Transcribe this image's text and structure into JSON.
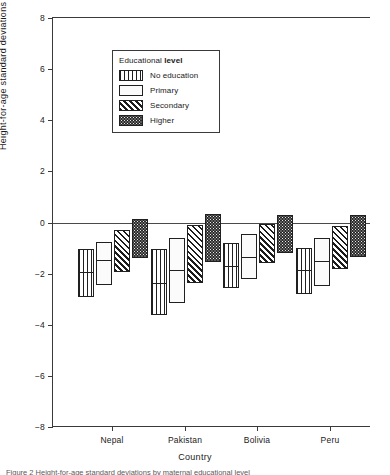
{
  "figure": {
    "caption_sliver": "Figure 2  Height-for-age standard deviations by maternal educational level"
  },
  "legend": {
    "title_prefix": "Educational ",
    "title_bold": "level",
    "position": "inside-top-center",
    "items": [
      {
        "label": "No education",
        "pattern": "vertical",
        "swatch_name": "legend-swatch-no-education"
      },
      {
        "label": "Primary",
        "pattern": "dots",
        "swatch_name": "legend-swatch-primary"
      },
      {
        "label": "Secondary",
        "pattern": "diagonal",
        "swatch_name": "legend-swatch-secondary"
      },
      {
        "label": "Higher",
        "pattern": "dense",
        "swatch_name": "legend-swatch-higher"
      }
    ]
  },
  "chart_data": {
    "type": "bar",
    "title": "",
    "subtitle": "",
    "xlabel": "Country",
    "ylabel": "Height-for-age  standard deviations",
    "ylim": [
      -8,
      8
    ],
    "yticks": [
      8,
      6,
      4,
      2,
      0,
      -2,
      -4,
      -6,
      -8
    ],
    "ytick_labels": [
      "8",
      "6",
      "4",
      "2",
      "0",
      "−2",
      "−4",
      "−6",
      "−8"
    ],
    "grid": false,
    "zero_line": 0,
    "categories": [
      "Nepal",
      "Pakistan",
      "Bolivia",
      "Peru"
    ],
    "series": [
      {
        "name": "No education",
        "pattern": "vertical",
        "low": [
          -2.9,
          -3.6,
          -2.55,
          -2.8
        ],
        "median": [
          -1.95,
          -2.35,
          -1.7,
          -1.85
        ],
        "high": [
          -1.05,
          -1.05,
          -0.8,
          -1.0
        ]
      },
      {
        "name": "Primary",
        "pattern": "dots",
        "low": [
          -2.45,
          -3.15,
          -2.2,
          -2.5
        ],
        "median": [
          -1.45,
          -1.85,
          -1.35,
          -1.5
        ],
        "high": [
          -0.75,
          -0.6,
          -0.45,
          -0.6
        ]
      },
      {
        "name": "Secondary",
        "pattern": "diagonal",
        "low": [
          -1.95,
          -2.35,
          -1.6,
          -1.8
        ],
        "median": null,
        "high": [
          -0.3,
          -0.1,
          -0.05,
          -0.15
        ]
      },
      {
        "name": "Higher",
        "pattern": "dense",
        "low": [
          -1.4,
          -1.55,
          -1.2,
          -1.35
        ],
        "median": null,
        "high": [
          0.15,
          0.35,
          0.3,
          0.3
        ]
      }
    ],
    "group_centers_px": [
      112,
      185,
      257,
      330
    ],
    "bar_width_px": 16,
    "bar_gap_px": 2
  }
}
